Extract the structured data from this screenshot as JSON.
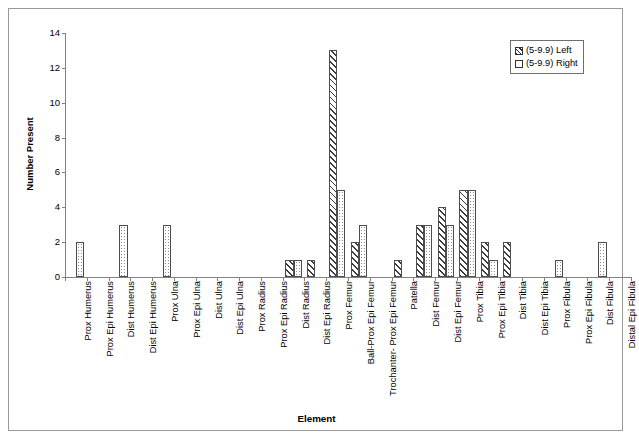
{
  "chart_data": {
    "type": "bar",
    "title": "",
    "xlabel": "Element",
    "ylabel": "Number Present",
    "ylim": [
      0,
      14
    ],
    "yticks": [
      0,
      2,
      4,
      6,
      8,
      10,
      12,
      14
    ],
    "grid": false,
    "legend_position": "top-right",
    "categories": [
      "Prox Humerus",
      "Prox Epi Humerus",
      "Dist Humerus",
      "Dist Epi Humerus",
      "Prox Ulna",
      "Prox Epi Ulna",
      "Dist Ulna",
      "Dist Epi Ulna",
      "Prox Radius",
      "Prox Epi Radius",
      "Dist Radius",
      "Dist Epi Radius",
      "Prox Femur",
      "Ball-Prox Epi Femur",
      "Trochanter- Prox Epi Femur",
      "Patella",
      "Dist Femur",
      "Dist Epi Femur",
      "Prox Tibia",
      "Prox Epi Tibia",
      "Dist Tibia",
      "Dist Epi Tibia",
      "Prox Fibula",
      "Prox Epi Fibula",
      "Dist Fibula",
      "Distal Epi Fibula"
    ],
    "series": [
      {
        "name": "(5-9.9) Left",
        "pattern": "diagonal-hatch",
        "values": [
          0,
          0,
          0,
          0,
          0,
          0,
          0,
          0,
          0,
          0,
          1,
          1,
          13,
          2,
          0,
          1,
          3,
          4,
          5,
          2,
          2,
          0,
          0,
          0,
          0,
          0
        ]
      },
      {
        "name": "(5-9.9) Right",
        "pattern": "dotted-stipple",
        "values": [
          2,
          0,
          3,
          0,
          3,
          0,
          0,
          0,
          0,
          0,
          1,
          0,
          5,
          3,
          0,
          0,
          3,
          3,
          5,
          1,
          0,
          0,
          1,
          0,
          2,
          0
        ]
      }
    ]
  },
  "legend": {
    "items": [
      {
        "label": "(5-9.9) Left"
      },
      {
        "label": "(5-9.9) Right"
      }
    ]
  },
  "axes": {
    "y_title": "Number Present",
    "x_title": "Element"
  }
}
